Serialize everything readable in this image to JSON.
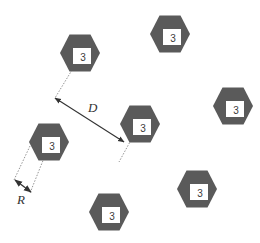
{
  "diagram": {
    "type": "hexagonal-node-layout",
    "colors": {
      "hexagon_fill": "#5a5a5a",
      "inner_square_fill": "#ffffff",
      "line": "#444444",
      "background": "#ffffff"
    },
    "nodes": [
      {
        "id": "hex-1",
        "cx": 80,
        "cy": 53,
        "label": "3"
      },
      {
        "id": "hex-2",
        "cx": 170,
        "cy": 34,
        "label": "3"
      },
      {
        "id": "hex-3",
        "cx": 233,
        "cy": 106,
        "label": "3"
      },
      {
        "id": "hex-4",
        "cx": 140,
        "cy": 124,
        "label": "3"
      },
      {
        "id": "hex-5",
        "cx": 49,
        "cy": 142,
        "label": "3"
      },
      {
        "id": "hex-6",
        "cx": 197,
        "cy": 189,
        "label": "3"
      },
      {
        "id": "hex-7",
        "cx": 109,
        "cy": 212,
        "label": "3"
      }
    ],
    "dimensions": {
      "distance": {
        "label": "D",
        "from": [
          55,
          98
        ],
        "to": [
          124,
          142
        ],
        "label_pos": [
          88,
          112
        ]
      },
      "radius": {
        "label": "R",
        "from": [
          15,
          180
        ],
        "to": [
          31,
          192
        ],
        "label_pos": [
          17,
          204
        ]
      }
    }
  }
}
